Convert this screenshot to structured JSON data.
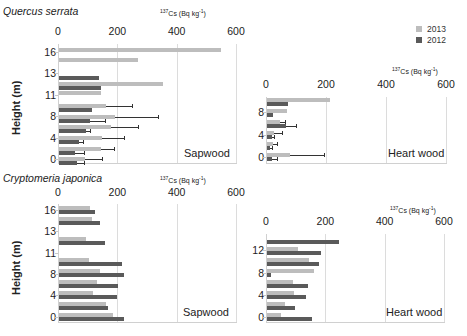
{
  "legend": {
    "items": [
      {
        "label": "2013",
        "color": "#bdbdbd"
      },
      {
        "label": "2012",
        "color": "#5a5a5a"
      }
    ]
  },
  "colors": {
    "y2013": "#bdbdbd",
    "y2012": "#5a5a5a",
    "grid": "#dcdcdc"
  },
  "chart_data": [
    {
      "type": "bar",
      "orientation": "horizontal",
      "species": "Quercus serrata",
      "tissue": "Sapwood",
      "xlabel": "137Cs (Bq kg-1)",
      "ylabel": "Height (m)",
      "xlim": [
        0,
        600
      ],
      "xticks": [
        "0",
        "200",
        "400",
        "600"
      ],
      "yticks": [
        "16",
        "13",
        "11",
        "8",
        "4",
        "0"
      ],
      "grid": true,
      "heights_m": [
        16,
        15,
        13,
        12,
        11,
        9,
        8,
        6,
        4,
        2,
        0
      ],
      "series": [
        {
          "name": "2013",
          "values": [
            545,
            267,
            null,
            350,
            140,
            160,
            190,
            176,
            146,
            140,
            88
          ],
          "error_upper": [
            null,
            null,
            null,
            null,
            null,
            247,
            335,
            265,
            218,
            184,
            146
          ]
        },
        {
          "name": "2012",
          "values": [
            null,
            null,
            135,
            140,
            null,
            112,
            105,
            92,
            68,
            54,
            61
          ],
          "error_upper": [
            null,
            null,
            null,
            null,
            null,
            null,
            155,
            105,
            82,
            85,
            85
          ]
        }
      ]
    },
    {
      "type": "bar",
      "orientation": "horizontal",
      "species": "Quercus serrata",
      "tissue": "Heart wood",
      "xlabel": "137Cs (Bq kg-1)",
      "ylabel": "Height (m)",
      "xlim": [
        0,
        600
      ],
      "xticks": [
        "0",
        "200",
        "400",
        "600"
      ],
      "yticks": [
        "8",
        "4",
        "0"
      ],
      "grid": true,
      "heights_m": [
        10,
        8,
        6,
        4,
        2,
        0
      ],
      "series": [
        {
          "name": "2013",
          "values": [
            210,
            68,
            44,
            24,
            20,
            78
          ],
          "error_upper": [
            null,
            null,
            61,
            51,
            34,
            190
          ]
        },
        {
          "name": "2012",
          "values": [
            71,
            20,
            64,
            17,
            10,
            17
          ],
          "error_upper": [
            null,
            null,
            98,
            24,
            17,
            34
          ]
        }
      ]
    },
    {
      "type": "bar",
      "orientation": "horizontal",
      "species": "Cryptomeria japonica",
      "tissue": "Sapwood",
      "xlabel": "137Cs (Bq kg-1)",
      "ylabel": "Height (m)",
      "xlim": [
        0,
        600
      ],
      "xticks": [
        "0",
        "200",
        "400",
        "600"
      ],
      "yticks": [
        "16",
        "13",
        "11",
        "8",
        "4",
        "0"
      ],
      "grid": true,
      "heights_m": [
        16,
        14,
        12,
        9,
        8,
        6,
        4,
        2,
        0
      ],
      "series": [
        {
          "name": "2013",
          "values": [
            105,
            112,
            92,
            102,
            139,
            129,
            115,
            159,
            183
          ]
        },
        {
          "name": "2012",
          "values": [
            122,
            139,
            156,
            214,
            220,
            200,
            197,
            166,
            220
          ]
        }
      ]
    },
    {
      "type": "bar",
      "orientation": "horizontal",
      "species": "Cryptomeria japonica",
      "tissue": "Heart wood",
      "xlabel": "137Cs (Bq kg-1)",
      "ylabel": "Height (m)",
      "xlim": [
        0,
        600
      ],
      "xticks": [
        "0",
        "200",
        "400",
        "600"
      ],
      "yticks": [
        "12",
        "8",
        "4",
        "0"
      ],
      "grid": true,
      "heights_m": [
        14,
        12,
        10,
        8,
        6,
        4,
        2,
        0
      ],
      "series": [
        {
          "name": "2013",
          "values": [
            null,
            105,
            142,
            159,
            88,
            92,
            61,
            47
          ]
        },
        {
          "name": "2012",
          "values": [
            244,
            183,
            176,
            15,
            139,
            132,
            95,
            153
          ]
        }
      ]
    }
  ],
  "panels": [
    {
      "species": "Quercus serrata",
      "unit_prefix": "137",
      "unit_main": "Cs (Bq kg",
      "unit_exp": "-1",
      "unit_close": ")",
      "tissue": "Sapwood",
      "ylabel": "Height (m)"
    },
    {
      "species": "",
      "unit_prefix": "137",
      "unit_main": "Cs (Bq kg",
      "unit_exp": "-1",
      "unit_close": ")",
      "tissue": "Heart wood",
      "ylabel": ""
    },
    {
      "species": "Cryptomeria japonica",
      "unit_prefix": "137",
      "unit_main": "Cs (Bq kg",
      "unit_exp": "-1",
      "unit_close": ")",
      "tissue": "Sapwood",
      "ylabel": "Height (m)"
    },
    {
      "species": "",
      "unit_prefix": "137",
      "unit_main": "Cs (Bq kg",
      "unit_exp": "-1",
      "unit_close": ")",
      "tissue": "Heart wood",
      "ylabel": ""
    }
  ]
}
